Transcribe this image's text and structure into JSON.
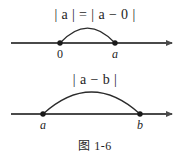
{
  "figure": {
    "caption": "图 1-6",
    "background_color": "#ffffff",
    "ink_color": "#4a4a4a",
    "text_color": "#1e1e1e"
  },
  "diagram_data": {
    "type": "diagram",
    "subject": "absolute value as distance on the number line",
    "panels": [
      {
        "id": "panel-top",
        "expression": "| a | = | a − 0 |",
        "axis": {
          "y": 43,
          "x_start": 11,
          "x_end": 178,
          "arrow_end": "right"
        },
        "points": [
          {
            "label": "0",
            "x": 60,
            "italic": false
          },
          {
            "label": "a",
            "x": 115,
            "italic": true
          }
        ],
        "arc": {
          "from_x": 60,
          "to_x": 115,
          "apex_y": 27
        }
      },
      {
        "id": "panel-bottom",
        "expression": "| a − b |",
        "axis": {
          "y": 114,
          "x_start": 11,
          "x_end": 178,
          "arrow_end": "right"
        },
        "points": [
          {
            "label": "a",
            "x": 43,
            "italic": true
          },
          {
            "label": "b",
            "x": 140,
            "italic": true
          }
        ],
        "arc": {
          "from_x": 43,
          "to_x": 140,
          "apex_y": 92
        }
      }
    ]
  }
}
